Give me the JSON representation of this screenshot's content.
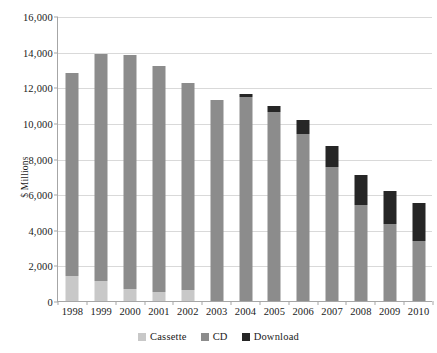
{
  "chart_data": {
    "type": "bar",
    "stacked": true,
    "title": "",
    "subtitle": "",
    "xlabel": "",
    "ylabel": "$ Millions",
    "ylim": [
      0,
      16000
    ],
    "ytick_step": 2000,
    "ytick_labels": [
      "16,000",
      "14,000",
      "12,000",
      "10,000",
      "8,000",
      "6,000",
      "4,000",
      "2,000",
      "0"
    ],
    "ytick_values": [
      16000,
      14000,
      12000,
      10000,
      8000,
      6000,
      4000,
      2000,
      0
    ],
    "grid": "horizontal",
    "legend_position": "bottom",
    "categories": [
      "1998",
      "1999",
      "2000",
      "2001",
      "2002",
      "2003",
      "2004",
      "2005",
      "2006",
      "2007",
      "2008",
      "2009",
      "2010"
    ],
    "series": [
      {
        "name": "Cassette",
        "color": "#c8c8c8",
        "values": [
          1400,
          1150,
          700,
          500,
          600,
          0,
          0,
          0,
          0,
          0,
          0,
          0,
          0
        ]
      },
      {
        "name": "CD",
        "color": "#8c8c8c",
        "values": [
          11400,
          12700,
          13100,
          12700,
          11650,
          11300,
          11450,
          10600,
          9400,
          7550,
          5400,
          4300,
          3350
        ]
      },
      {
        "name": "Download",
        "color": "#262626",
        "values": [
          0,
          0,
          0,
          0,
          0,
          0,
          150,
          350,
          750,
          1150,
          1700,
          1900,
          2150
        ]
      }
    ],
    "totals": [
      12800,
      13850,
      13800,
      13200,
      12250,
      11300,
      11600,
      10950,
      10150,
      8700,
      7100,
      6200,
      5500
    ]
  },
  "legend": {
    "items": [
      {
        "label": "Cassette",
        "color": "#c8c8c8"
      },
      {
        "label": "CD",
        "color": "#8c8c8c"
      },
      {
        "label": "Download",
        "color": "#262626"
      }
    ]
  },
  "axes": {
    "y_title": "$ Millions"
  }
}
